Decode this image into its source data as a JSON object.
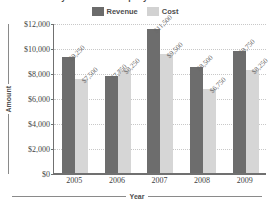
{
  "chart_data": {
    "type": "bar",
    "title": "Lazy Daze Bike Company Revenue and Cost",
    "xlabel": "Year",
    "ylabel": "Amount",
    "categories": [
      "2005",
      "2006",
      "2007",
      "2008",
      "2009"
    ],
    "series": [
      {
        "name": "Revenue",
        "color": "#6d6d6d",
        "values": [
          9250,
          7750,
          11500,
          8500,
          9750
        ],
        "labels": [
          "$9,250",
          "$7,750",
          "$11,500",
          "$8,500",
          "$9,750"
        ]
      },
      {
        "name": "Cost",
        "color": "#d6d6d6",
        "values": [
          7500,
          8250,
          9500,
          6750,
          8250
        ],
        "labels": [
          "$7,500",
          "$8,250",
          "$9,500",
          "$6,750",
          "$8,250"
        ]
      }
    ],
    "ylim": [
      0,
      12000
    ],
    "ytick_values": [
      12000,
      10000,
      8000,
      6000,
      4000,
      2000,
      0
    ],
    "ytick_labels": [
      "$12,000",
      "$10,000",
      "$8,000",
      "$6,000",
      "$4,000",
      "$2,000",
      "$0"
    ],
    "grid": true,
    "grid_style": "dotted-horizontal",
    "legend_position": "top-center",
    "data_labels": true,
    "data_label_rotation": -45
  },
  "legend": {
    "entries": [
      {
        "label": "Revenue",
        "swatch": "revenue"
      },
      {
        "label": "Cost",
        "swatch": "cost"
      }
    ]
  },
  "axes": {
    "y_title": "Amount",
    "x_title": "Year"
  }
}
